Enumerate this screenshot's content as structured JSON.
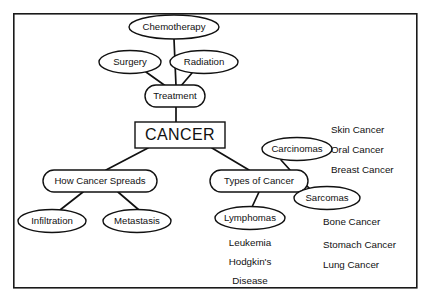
{
  "diagram": {
    "title": "CANCER",
    "type": "concept-map",
    "frame": {
      "x": 13,
      "y": 13,
      "width": 404,
      "height": 275,
      "border_color": "#1a1a1a"
    },
    "background_color": "#ffffff",
    "line_color": "#111111",
    "nodes": [
      {
        "id": "chemotherapy",
        "label": "Chemotherapy",
        "shape": "ellipse",
        "cx": 174,
        "cy": 27,
        "rx": 45,
        "ry": 12
      },
      {
        "id": "surgery",
        "label": "Surgery",
        "shape": "ellipse",
        "cx": 130,
        "cy": 62,
        "rx": 31,
        "ry": 11.5
      },
      {
        "id": "radiation",
        "label": "Radiation",
        "shape": "ellipse",
        "cx": 204,
        "cy": 62,
        "rx": 34,
        "ry": 11.5
      },
      {
        "id": "treatment",
        "label": "Treatment",
        "shape": "stadium",
        "cx": 175,
        "cy": 96,
        "rx": 30,
        "ry": 11
      },
      {
        "id": "cancer",
        "label": "CANCER",
        "shape": "rect",
        "cx": 180,
        "cy": 135,
        "rx": 45,
        "ry": 13
      },
      {
        "id": "how-cancer-spreads",
        "label": "How Cancer Spreads",
        "shape": "stadium",
        "cx": 100,
        "cy": 181,
        "rx": 57,
        "ry": 11
      },
      {
        "id": "types-of-cancer",
        "label": "Types of Cancer",
        "shape": "stadium",
        "cx": 259,
        "cy": 181,
        "rx": 49,
        "ry": 11
      },
      {
        "id": "infiltration",
        "label": "Infiltration",
        "shape": "ellipse",
        "cx": 52,
        "cy": 221,
        "rx": 34,
        "ry": 11.5
      },
      {
        "id": "metastasis",
        "label": "Metastasis",
        "shape": "ellipse",
        "cx": 137,
        "cy": 221,
        "rx": 34,
        "ry": 11.5
      },
      {
        "id": "carcinomas",
        "label": "Carcinomas",
        "shape": "ellipse",
        "cx": 297,
        "cy": 149,
        "rx": 35,
        "ry": 11.5
      },
      {
        "id": "sarcomas",
        "label": "Sarcomas",
        "shape": "ellipse",
        "cx": 327,
        "cy": 198,
        "rx": 33,
        "ry": 11.5
      },
      {
        "id": "lymphomas",
        "label": "Lymphomas",
        "shape": "ellipse",
        "cx": 250,
        "cy": 218,
        "rx": 35,
        "ry": 11.5
      }
    ],
    "edges": [
      {
        "from": "chemotherapy",
        "to": "treatment",
        "x1": 174,
        "y1": 39,
        "x2": 176,
        "y2": 86
      },
      {
        "from": "surgery",
        "to": "treatment",
        "x1": 146,
        "y1": 72,
        "x2": 167,
        "y2": 87
      },
      {
        "from": "radiation",
        "to": "treatment",
        "x1": 192,
        "y1": 73,
        "x2": 180,
        "y2": 87
      },
      {
        "from": "treatment",
        "to": "cancer",
        "x1": 176,
        "y1": 107,
        "x2": 176,
        "y2": 123
      },
      {
        "from": "cancer",
        "to": "how-cancer-spreads",
        "x1": 148,
        "y1": 148,
        "x2": 106,
        "y2": 170
      },
      {
        "from": "cancer",
        "to": "types-of-cancer",
        "x1": 212,
        "y1": 148,
        "x2": 249,
        "y2": 170
      },
      {
        "from": "how-cancer-spreads",
        "to": "infiltration",
        "x1": 83,
        "y1": 192,
        "x2": 60,
        "y2": 210
      },
      {
        "from": "how-cancer-spreads",
        "to": "metastasis",
        "x1": 118,
        "y1": 192,
        "x2": 139,
        "y2": 210
      },
      {
        "from": "types-of-cancer",
        "to": "carcinomas",
        "x1": 290,
        "y1": 170,
        "x2": 281,
        "y2": 160
      },
      {
        "from": "types-of-cancer",
        "to": "sarcomas",
        "x1": 303,
        "y1": 182,
        "x2": 312,
        "y2": 191
      },
      {
        "from": "types-of-cancer",
        "to": "lymphomas",
        "x1": 259,
        "y1": 192,
        "x2": 252,
        "y2": 207
      }
    ],
    "plain_text_groups": [
      {
        "id": "carcinoma-examples",
        "parent": "carcinomas",
        "align": "left",
        "x": 331,
        "items": [
          {
            "label": "Skin Cancer",
            "y": 130
          },
          {
            "label": "Oral Cancer",
            "y": 150
          },
          {
            "label": "Breast Cancer",
            "y": 170
          }
        ]
      },
      {
        "id": "sarcoma-examples",
        "parent": "sarcomas",
        "align": "left",
        "x": 323,
        "items": [
          {
            "label": "Bone Cancer",
            "y": 222
          },
          {
            "label": "Stomach Cancer",
            "y": 245
          },
          {
            "label": "Lung Cancer",
            "y": 265
          }
        ]
      },
      {
        "id": "lymphoma-examples",
        "parent": "lymphomas",
        "align": "center",
        "x": 250,
        "items": [
          {
            "label": "Leukemia",
            "y": 243
          },
          {
            "label": "Hodgkin's",
            "y": 262
          },
          {
            "label": "Disease",
            "y": 281
          }
        ]
      }
    ]
  }
}
